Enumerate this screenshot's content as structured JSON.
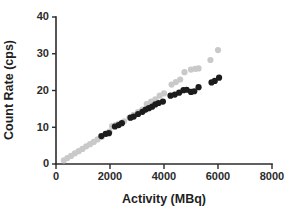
{
  "chart_data": {
    "type": "scatter",
    "title": "",
    "xlabel": "Activity (MBq)",
    "ylabel": "Count Rate (cps)",
    "xlim": [
      0,
      8000
    ],
    "ylim": [
      0,
      40
    ],
    "xticks": [
      0,
      2000,
      4000,
      6000,
      8000
    ],
    "yticks": [
      0,
      10,
      20,
      30,
      40
    ],
    "xtick_labels": [
      "0",
      "2000",
      "4000",
      "6000",
      "8000"
    ],
    "ytick_labels": [
      "0",
      "10",
      "20",
      "30",
      "40"
    ],
    "grid": false,
    "legend": "none",
    "colors": {
      "series_light": "#c9c9c9",
      "series_dark": "#1c1c1c",
      "axis": "#2b2b2b",
      "background": "#ffffff"
    },
    "marker": {
      "shape": "circle",
      "radius_px": 3.1
    },
    "series": [
      {
        "name": "light-gray-series",
        "color": "#c9c9c9",
        "points": [
          [
            290,
            1.0
          ],
          [
            420,
            1.6
          ],
          [
            560,
            2.2
          ],
          [
            700,
            2.9
          ],
          [
            840,
            3.5
          ],
          [
            980,
            4.1
          ],
          [
            1120,
            4.8
          ],
          [
            1260,
            5.4
          ],
          [
            1400,
            6.0
          ],
          [
            1540,
            6.7
          ],
          [
            1700,
            7.4
          ],
          [
            1860,
            8.2
          ],
          [
            1980,
            8.8
          ],
          [
            2080,
            10.3
          ],
          [
            2200,
            10.6
          ],
          [
            2320,
            10.9
          ],
          [
            2520,
            11.6
          ],
          [
            2720,
            12.6
          ],
          [
            2880,
            13.4
          ],
          [
            3040,
            14.1
          ],
          [
            3200,
            14.8
          ],
          [
            3360,
            16.3
          ],
          [
            3520,
            17.0
          ],
          [
            3680,
            17.6
          ],
          [
            3840,
            18.6
          ],
          [
            4000,
            19.2
          ],
          [
            4280,
            21.6
          ],
          [
            4440,
            22.3
          ],
          [
            4600,
            23.0
          ],
          [
            4760,
            25.0
          ],
          [
            5000,
            25.7
          ],
          [
            5160,
            25.9
          ],
          [
            5280,
            26.0
          ],
          [
            5720,
            28.3
          ],
          [
            6000,
            31.0
          ]
        ]
      },
      {
        "name": "dark-black-series",
        "color": "#1c1c1c",
        "points": [
          [
            1680,
            7.6
          ],
          [
            1840,
            8.2
          ],
          [
            1960,
            8.4
          ],
          [
            2180,
            10.2
          ],
          [
            2320,
            10.6
          ],
          [
            2440,
            11.1
          ],
          [
            2760,
            12.6
          ],
          [
            2880,
            12.9
          ],
          [
            3040,
            13.6
          ],
          [
            3200,
            14.2
          ],
          [
            3320,
            14.8
          ],
          [
            3440,
            15.2
          ],
          [
            3560,
            15.6
          ],
          [
            3680,
            16.2
          ],
          [
            3800,
            16.6
          ],
          [
            3960,
            17.0
          ],
          [
            4240,
            18.6
          ],
          [
            4400,
            18.9
          ],
          [
            4560,
            19.4
          ],
          [
            4720,
            20.1
          ],
          [
            4840,
            20.2
          ],
          [
            5000,
            19.6
          ],
          [
            5120,
            19.8
          ],
          [
            5280,
            20.9
          ],
          [
            5760,
            22.2
          ],
          [
            5880,
            22.6
          ],
          [
            6040,
            23.5
          ]
        ]
      }
    ]
  }
}
